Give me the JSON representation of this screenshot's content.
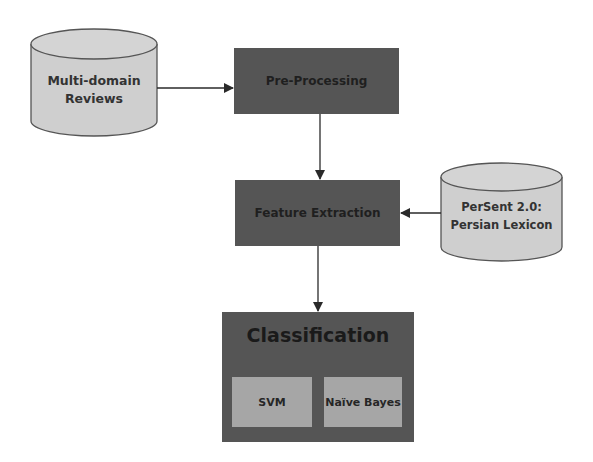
{
  "diagram": {
    "nodes": {
      "source_reviews": {
        "label_line1": "Multi-domain",
        "label_line2": "Reviews",
        "shape": "cylinder"
      },
      "preprocessing": {
        "label": "Pre-Processing",
        "shape": "rectangle"
      },
      "feature_extraction": {
        "label": "Feature Extraction",
        "shape": "rectangle"
      },
      "lexicon": {
        "label_line1": "PerSent 2.0:",
        "label_line2": "Persian Lexicon",
        "shape": "cylinder"
      },
      "classification": {
        "label": "Classification",
        "shape": "rectangle",
        "children": [
          {
            "label": "SVM"
          },
          {
            "label": "Naïve Bayes"
          }
        ]
      }
    },
    "edges": [
      {
        "from": "Multi-domain Reviews",
        "to": "Pre-Processing"
      },
      {
        "from": "Pre-Processing",
        "to": "Feature Extraction"
      },
      {
        "from": "PerSent 2.0: Persian Lexicon",
        "to": "Feature Extraction"
      },
      {
        "from": "Feature Extraction",
        "to": "Classification"
      }
    ],
    "colors": {
      "process_box": "#555555",
      "data_store": "#cfcfcf",
      "inner_box": "#a6a6a6",
      "stroke": "#3a3a3a",
      "text": "#222222"
    }
  }
}
